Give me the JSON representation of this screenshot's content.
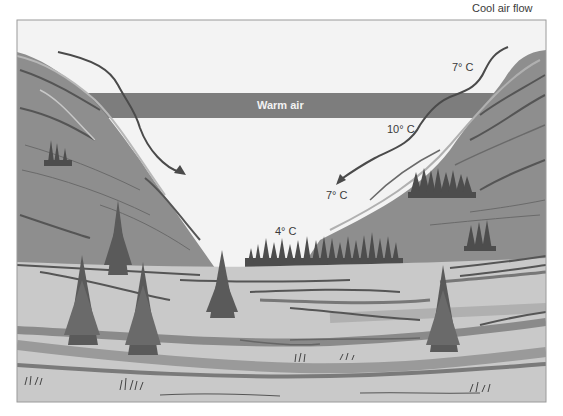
{
  "diagram": {
    "title": "",
    "labels": {
      "cool_air_flow": "Cool air flow",
      "warm_air": "Warm air",
      "temp_top_right": "7° C",
      "temp_mid_right": "10° C",
      "temp_lower_mid": "7° C",
      "temp_valley_floor": "4° C"
    },
    "colors": {
      "sky": "#f3f3f3",
      "warm_band": "#7d7d7d",
      "mountain": "#8e8e8e",
      "mountain_light": "#a9a9a9",
      "ridge_lines": "#555555",
      "meadow": "#c9c9c9",
      "meadow_dark": "#8a8a8a",
      "trees": "#4d4d4d",
      "arrow": "#4a4a4a",
      "frame": "#9a9a9a"
    }
  }
}
